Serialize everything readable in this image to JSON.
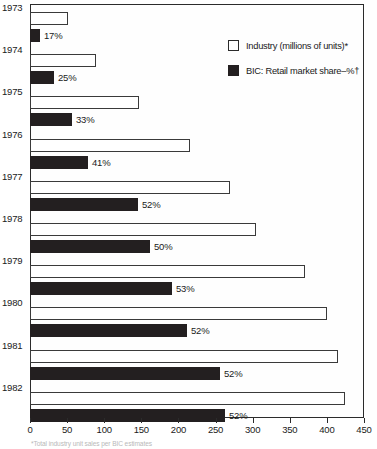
{
  "chart_data": {
    "type": "bar",
    "orientation": "horizontal",
    "title": "",
    "xlabel": "",
    "ylabel": "",
    "xlim": [
      0,
      450
    ],
    "xticks": [
      0,
      50,
      100,
      150,
      200,
      250,
      300,
      350,
      400,
      450
    ],
    "grid": false,
    "legend_position": "top-right",
    "categories": [
      "1973",
      "1974",
      "1975",
      "1976",
      "1977",
      "1978",
      "1979",
      "1980",
      "1981",
      "1982"
    ],
    "series": [
      {
        "name": "Industry (millions of units)*",
        "key": "industry",
        "color": "#ffffff",
        "edge_color": "#3a3a3a",
        "values": [
          51,
          89,
          147,
          215,
          270,
          305,
          370,
          400,
          415,
          425
        ]
      },
      {
        "name": "BIC: Retail market share–%†",
        "key": "share",
        "color": "#231f20",
        "edge_color": "#231f20",
        "values": [
          17,
          25,
          33,
          41,
          52,
          50,
          53,
          52,
          52,
          52
        ],
        "data_labels": [
          "17%",
          "25%",
          "33%",
          "41%",
          "52%",
          "50%",
          "53%",
          "52%",
          "52%",
          "52%"
        ]
      }
    ],
    "share_bar_pixel_widths": [
      10,
      24,
      42,
      58,
      108,
      120,
      142,
      157,
      190,
      195
    ],
    "footnote": "*Total industry unit sales per BIC estimates"
  },
  "legend": {
    "items": [
      {
        "label": "Industry (millions of units)*",
        "swatch": "open-square"
      },
      {
        "label": "BIC: Retail market share–%†",
        "swatch": "filled-square"
      }
    ]
  },
  "axis": {
    "tick_labels": [
      "0",
      "50",
      "100",
      "150",
      "200",
      "250",
      "300",
      "350",
      "400",
      "450"
    ]
  }
}
